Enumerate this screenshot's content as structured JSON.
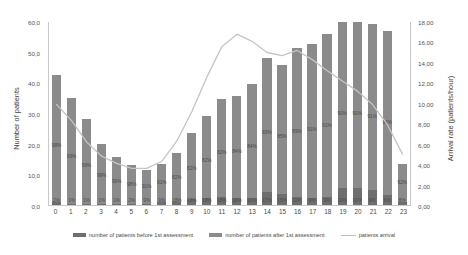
{
  "chart_data": {
    "type": "bar",
    "title": "",
    "xlabel": "",
    "ylabel": "Number of patients",
    "y2label": "Arrival rate (patients/hour)",
    "categories": [
      "0",
      "1",
      "2",
      "3",
      "4",
      "5",
      "6",
      "7",
      "8",
      "9",
      "10",
      "11",
      "12",
      "13",
      "14",
      "15",
      "16",
      "17",
      "18",
      "19",
      "20",
      "21",
      "22",
      "23"
    ],
    "ylim": [
      0,
      60
    ],
    "y2lim": [
      0,
      18
    ],
    "yticks": [
      "0,0",
      "10,0",
      "20,0",
      "30,0",
      "40,0",
      "50,0",
      "60,0"
    ],
    "y2ticks": [
      "0,00",
      "2,00",
      "4,00",
      "6,00",
      "8,00",
      "10,00",
      "12,00",
      "14,00",
      "16,00",
      "18,00"
    ],
    "grid": false,
    "legend_position": "bottom",
    "series": [
      {
        "name": "number of patients before 1st assessment",
        "type": "bar-stacked-bottom",
        "color": "#6e6e6e",
        "values": [
          0.9,
          0.4,
          0.3,
          0.2,
          0.3,
          0.3,
          0.3,
          1.0,
          1.1,
          1.9,
          2.2,
          2.5,
          2.3,
          2.4,
          4.1,
          3.6,
          2.6,
          2.4,
          2.6,
          5.5,
          5.5,
          5.0,
          3.3,
          1.1
        ],
        "labels": [
          "2%",
          "1%",
          "1%",
          "1%",
          "1%",
          "2%",
          "9%",
          "9%",
          "18%",
          "18%",
          "18%",
          "18%",
          "16%",
          "16%",
          "17%",
          "15%",
          "11%",
          "9%",
          "9%",
          "10%",
          "10%",
          "9%",
          "6%",
          "8%"
        ]
      },
      {
        "name": "number of patients after 1st assessment",
        "type": "bar-stacked-top",
        "color": "#8b8b8b",
        "values": [
          41.6,
          34.6,
          27.7,
          19.8,
          15.2,
          12.7,
          11.0,
          12.5,
          16.0,
          21.5,
          26.8,
          32.2,
          33.3,
          37.1,
          43.7,
          42.0,
          48.5,
          50.2,
          53.1,
          55.2,
          55.3,
          54.0,
          53.5,
          12.3
        ],
        "labels": [
          "98%",
          "99%",
          "99%",
          "99%",
          "99%",
          "98%",
          "91%",
          "91%",
          "82%",
          "82%",
          "82%",
          "82%",
          "84%",
          "84%",
          "83%",
          "85%",
          "89%",
          "91%",
          "91%",
          "90%",
          "90%",
          "91%",
          "94%",
          "92%"
        ]
      },
      {
        "name": "patients arrival",
        "type": "line",
        "axis": "secondary",
        "color": "#c4c4c4",
        "values": [
          9.9,
          8.3,
          6.2,
          4.8,
          4.1,
          3.6,
          3.6,
          4.3,
          6.3,
          9.2,
          12.6,
          15.6,
          16.8,
          16.1,
          15.0,
          14.7,
          15.2,
          14.3,
          13.2,
          12.2,
          11.2,
          9.9,
          7.9,
          5.0
        ]
      }
    ]
  },
  "legend": {
    "before_label": "number of patients before 1st assessment",
    "after_label": "number of patients after 1st assessment",
    "line_label": "patients arrival"
  },
  "colors": {
    "bar_before": "#6e6e6e",
    "bar_after": "#8b8b8b",
    "line": "#c4c4c4",
    "axis": "#c8c8c8",
    "text": "#4a4a4a"
  }
}
